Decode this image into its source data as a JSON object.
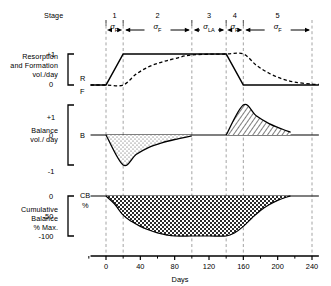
{
  "figure": {
    "stage_label": "Stage",
    "xlabel": "Days",
    "panels": [
      {
        "id": "resorption-formation",
        "label_lines": [
          "Resorption",
          "and Formation",
          "vol./day"
        ],
        "ytick_top": "+1",
        "ytick_zero": "0",
        "series_marks": [
          {
            "name": "R",
            "text": "R"
          },
          {
            "name": "F",
            "text": "F"
          }
        ]
      },
      {
        "id": "balance",
        "label_lines": [
          "Balance",
          "vol./ day"
        ],
        "ytick_top": "+1",
        "ytick_zero": "0",
        "ytick_bottom": "-1",
        "series_marks": [
          {
            "name": "B",
            "text": "B"
          }
        ]
      },
      {
        "id": "cumulative-balance",
        "label_lines": [
          "Cumulative",
          "Balance",
          "% Max."
        ],
        "ytick_zero": "0",
        "ytick_mid": "-50",
        "ytick_bottom": "-100",
        "series_marks": [
          {
            "name": "CB",
            "text": "CB"
          },
          {
            "name": "percent",
            "text": "%"
          }
        ]
      }
    ],
    "stages": [
      {
        "num": "1",
        "sigma": "σ",
        "sub": "R",
        "from_day": 0,
        "to_day": 20
      },
      {
        "num": "2",
        "sigma": "σ",
        "sub": "F",
        "from_day": 20,
        "to_day": 100
      },
      {
        "num": "3",
        "sigma": "σ",
        "sub": "LA",
        "from_day": 100,
        "to_day": 140
      },
      {
        "num": "4",
        "sigma": "σ",
        "sub": "R",
        "from_day": 140,
        "to_day": 160
      },
      {
        "num": "5",
        "sigma": "σ",
        "sub": "F",
        "from_day": 160,
        "to_day": 240
      }
    ],
    "xticks": [
      "0",
      "40",
      "80",
      "120",
      "160",
      "200",
      "240"
    ],
    "divider_days": [
      0,
      20,
      100,
      140,
      160,
      240
    ],
    "colors": {
      "ink": "#000000",
      "divider": "#9a9a9a",
      "background": "#ffffff"
    }
  },
  "chart_data": [
    {
      "type": "line",
      "id": "resorption-formation",
      "title": "Resorption and Formation vol./day",
      "xlabel": "Days",
      "ylabel": "vol./day",
      "xlim": [
        -18,
        248
      ],
      "ylim": [
        0,
        1
      ],
      "yticks": [
        0,
        1
      ],
      "ytick_labels": [
        "0",
        "+1"
      ],
      "grid": false,
      "legend": "inline",
      "series": [
        {
          "name": "R",
          "style": "solid",
          "comment": "Resorption rate: flat 0 before day 0, ramps 0->1 over stage 1, plateau at 1 through stage 3, ramps 1->0 over stage 4, then 0",
          "x": [
            -18,
            0,
            20,
            100,
            140,
            160,
            240,
            248
          ],
          "y": [
            0,
            0,
            1,
            1,
            1,
            0,
            0,
            0
          ]
        },
        {
          "name": "F",
          "style": "dashed",
          "comment": "Formation rate: 0 until day 20, exponential rise to 1 by day 100, plateau to day 160, exponential decay toward 0 by day 215",
          "x": [
            -18,
            0,
            20,
            35,
            50,
            65,
            80,
            100,
            140,
            160,
            175,
            190,
            205,
            220,
            240,
            248
          ],
          "y": [
            0,
            0,
            0,
            0.35,
            0.59,
            0.74,
            0.85,
            0.97,
            1,
            1,
            0.64,
            0.38,
            0.2,
            0.09,
            0.03,
            0.02
          ]
        }
      ]
    },
    {
      "type": "area",
      "id": "balance",
      "title": "Balance vol./day",
      "xlabel": "Days",
      "ylabel": "vol./day",
      "xlim": [
        -18,
        248
      ],
      "ylim": [
        -1,
        1
      ],
      "yticks": [
        -1,
        0,
        1
      ],
      "ytick_labels": [
        "-1",
        "0",
        "+1"
      ],
      "grid": false,
      "series": [
        {
          "name": "B",
          "style": "solid",
          "comment": "Balance = F - R. Negative lobe (stippled) day 0-100 with minimum -1 at day 20; positive lobe (hatched) day 140-215 with maximum +1 at day 160",
          "x": [
            -18,
            0,
            20,
            35,
            50,
            65,
            80,
            100,
            140,
            160,
            175,
            190,
            205,
            215,
            240,
            248
          ],
          "y": [
            0,
            0,
            -1,
            -0.65,
            -0.41,
            -0.26,
            -0.15,
            -0.03,
            0,
            1,
            0.64,
            0.38,
            0.2,
            0.09,
            0.02,
            0
          ]
        }
      ],
      "fills": [
        {
          "name": "resorption-deficit",
          "pattern": "stipple",
          "from_day": 0,
          "to_day": 100,
          "sign": "negative"
        },
        {
          "name": "formation-surplus",
          "pattern": "hatch",
          "from_day": 140,
          "to_day": 215,
          "sign": "positive"
        }
      ]
    },
    {
      "type": "area",
      "id": "cumulative-balance",
      "title": "Cumulative Balance % Max.",
      "xlabel": "Days",
      "ylabel": "% Max.",
      "xlim": [
        -18,
        248
      ],
      "ylim": [
        -100,
        0
      ],
      "yticks": [
        0,
        -50,
        -100
      ],
      "ytick_labels": [
        "0",
        "-50",
        "-100"
      ],
      "grid": false,
      "series": [
        {
          "name": "CB",
          "style": "solid",
          "comment": "Integral of balance: falls from 0 at day 0 to -100 by day 80, flat minimum to day 140, returns to 0 by about day 215",
          "x": [
            -18,
            0,
            10,
            20,
            30,
            40,
            50,
            60,
            70,
            80,
            100,
            120,
            140,
            150,
            160,
            170,
            180,
            190,
            200,
            210,
            215,
            240,
            248
          ],
          "y": [
            0,
            0,
            -20,
            -48,
            -64,
            -76,
            -85,
            -92,
            -97,
            -100,
            -100,
            -100,
            -100,
            -92,
            -76,
            -55,
            -36,
            -22,
            -11,
            -3,
            0,
            0,
            0
          ]
        }
      ],
      "fills": [
        {
          "name": "cumulative-deficit",
          "pattern": "checker",
          "from_day": 0,
          "to_day": 215,
          "sign": "negative"
        }
      ]
    }
  ]
}
